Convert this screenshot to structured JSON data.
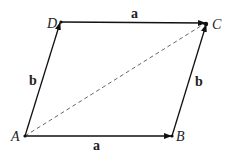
{
  "diagram": {
    "type": "parallelogram-vector-addition",
    "points": {
      "A": {
        "label": "A",
        "x": 25,
        "y": 136
      },
      "B": {
        "label": "B",
        "x": 172,
        "y": 136
      },
      "C": {
        "label": "C",
        "x": 206,
        "y": 23
      },
      "D": {
        "label": "D",
        "x": 61,
        "y": 22
      }
    },
    "edges": [
      {
        "from": "A",
        "to": "B",
        "label": "a",
        "style": "solid-arrow"
      },
      {
        "from": "A",
        "to": "D",
        "label": "b",
        "style": "solid-arrow"
      },
      {
        "from": "D",
        "to": "C",
        "label": "a",
        "style": "solid-arrow"
      },
      {
        "from": "B",
        "to": "C",
        "label": "b",
        "style": "solid-arrow"
      },
      {
        "from": "A",
        "to": "C",
        "label": "",
        "style": "dashed"
      }
    ],
    "labels": {
      "A": "A",
      "B": "B",
      "C": "C",
      "D": "D",
      "a_bottom": "a",
      "a_top": "a",
      "b_left": "b",
      "b_right": "b"
    },
    "colors": {
      "line": "#111111",
      "dashed": "#555555"
    }
  }
}
